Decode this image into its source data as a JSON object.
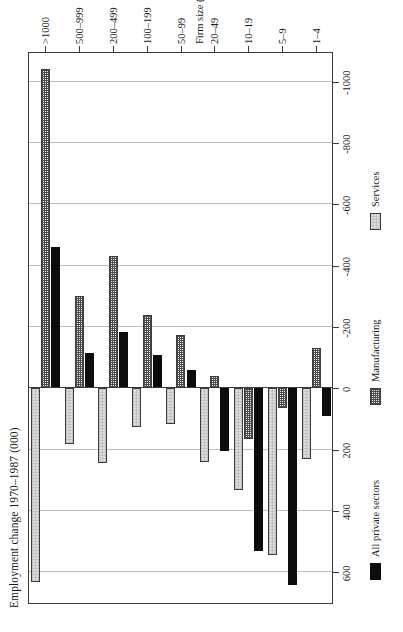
{
  "figure": {
    "value_axis_title": "Employment change 1970–1987 (000)",
    "category_axis_title": "Firm size (employees)"
  },
  "legend": {
    "items": [
      {
        "label": "All private sectors",
        "style": "solid-black",
        "color": "#0c0c0c"
      },
      {
        "label": "Manufacturing",
        "style": "cross-hatch",
        "color": "#4a4a4a"
      },
      {
        "label": "Services",
        "style": "light-stipple",
        "color": "#dedede"
      }
    ]
  },
  "chart_data": {
    "type": "bar",
    "orientation": "horizontal",
    "title": "Employment change 1970–1987 (000)",
    "xlabel": "Employment change 1970–1987 (000)",
    "ylabel": "Firm size (employees)",
    "categories": [
      "1–4",
      "5–9",
      "10–19",
      "20–49",
      "50–99",
      "100–199",
      "200–499",
      "500–999",
      ">1000"
    ],
    "tick_labels": [
      "600",
      "400",
      "200",
      "0",
      "-200",
      "-400",
      "-600",
      "-800",
      "-1000"
    ],
    "ticks": [
      600,
      400,
      200,
      0,
      -200,
      -400,
      -600,
      -800,
      -1000
    ],
    "xlim": [
      700,
      -1100
    ],
    "axis_direction": "decreasing-left-to-right",
    "grid": true,
    "legend_position": "below-plot",
    "series": [
      {
        "name": "All private sectors",
        "values": [
          90,
          640,
          530,
          205,
          -60,
          -110,
          -185,
          -115,
          -460
        ]
      },
      {
        "name": "Manufacturing",
        "values": [
          -130,
          65,
          165,
          -40,
          -175,
          -240,
          -430,
          -300,
          -1040
        ]
      },
      {
        "name": "Services",
        "values": [
          230,
          545,
          330,
          240,
          115,
          125,
          245,
          180,
          630
        ]
      }
    ]
  },
  "bleed_text": {
    "lines": [
      "employment change by size of firm",
      "the growth of small firms in the",
      "period since 1970 has been",
      "a notable feature of the economy",
      "with large firms shedding labour",
      "while the smallest size bands",
      "recorded substantial net gains",
      "across both manufacturing and",
      "service sector activities overall"
    ]
  }
}
